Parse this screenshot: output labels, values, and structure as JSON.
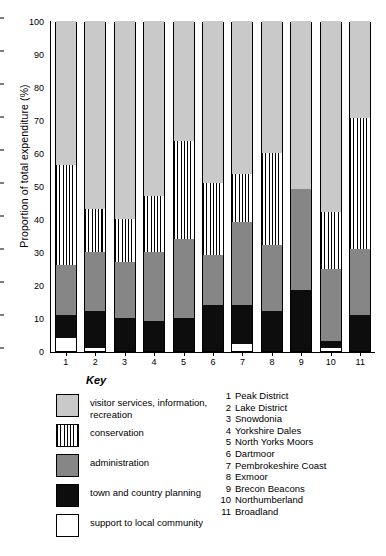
{
  "chart_data": {
    "type": "bar",
    "subtype": "stacked-bar-100-percent",
    "title": "",
    "xlabel": "",
    "ylabel": "Proportion of total expenditure (%)",
    "ylim": [
      0,
      100
    ],
    "yticks": [
      0,
      10,
      20,
      30,
      40,
      50,
      60,
      70,
      80,
      90,
      100
    ],
    "grid": false,
    "legend_position": "below-left",
    "legend_title": "Key",
    "categories": [
      "1",
      "2",
      "3",
      "4",
      "5",
      "6",
      "7",
      "8",
      "9",
      "10",
      "11"
    ],
    "category_names": [
      "Peak District",
      "Lake District",
      "Snowdonia",
      "Yorkshire Dales",
      "North Yorks Moors",
      "Dartmoor",
      "Pembrokeshire Coast",
      "Exmoor",
      "Brecon Beacons",
      "Northumberland",
      "Broadland"
    ],
    "series": [
      {
        "name": "support to local community",
        "color": "#ffffff",
        "pattern": "solid",
        "values": [
          4,
          1,
          0,
          0,
          0,
          0,
          2,
          0,
          0,
          1,
          0
        ]
      },
      {
        "name": "town and country planning",
        "color": "#0d0d0d",
        "pattern": "solid",
        "values": [
          7,
          11,
          10,
          9,
          10,
          14,
          12,
          12,
          18,
          2,
          11
        ]
      },
      {
        "name": "administration",
        "color": "#868686",
        "pattern": "solid",
        "values": [
          15,
          18,
          17,
          21,
          24,
          15,
          25,
          20,
          31,
          22,
          20
        ]
      },
      {
        "name": "conservation",
        "color": "#ffffff",
        "pattern": "vertical-lines",
        "values": [
          30.5,
          13,
          13,
          17,
          29.5,
          22,
          14.5,
          28,
          0,
          17,
          39.5
        ]
      },
      {
        "name": "visitor services, information, recreation",
        "color": "#c9c9c9",
        "pattern": "solid",
        "values": [
          43.5,
          57,
          60,
          53,
          36.5,
          49,
          46.5,
          40,
          51,
          58,
          29.5
        ]
      }
    ],
    "stack_tops": [
      {
        "category": "1",
        "support": 4,
        "town": 11,
        "admin": 26,
        "conservation": 56.5,
        "visitor": 100
      },
      {
        "category": "2",
        "support": 1,
        "town": 12,
        "admin": 30,
        "conservation": 43,
        "visitor": 100
      },
      {
        "category": "3",
        "support": 0,
        "town": 10,
        "admin": 27,
        "conservation": 40,
        "visitor": 100
      },
      {
        "category": "4",
        "support": 0,
        "town": 9,
        "admin": 30,
        "conservation": 47,
        "visitor": 100
      },
      {
        "category": "5",
        "support": 0,
        "town": 10,
        "admin": 34,
        "conservation": 63.5,
        "visitor": 100
      },
      {
        "category": "6",
        "support": 0,
        "town": 14,
        "admin": 29,
        "conservation": 51,
        "visitor": 100
      },
      {
        "category": "7",
        "support": 2,
        "town": 14,
        "admin": 39,
        "conservation": 53.5,
        "visitor": 100
      },
      {
        "category": "8",
        "support": 0,
        "town": 12,
        "admin": 32,
        "conservation": 60,
        "visitor": 100
      },
      {
        "category": "9",
        "support": 0,
        "town": 18.5,
        "admin": 49,
        "conservation": 49,
        "visitor": 100
      },
      {
        "category": "10",
        "support": 1,
        "town": 3,
        "admin": 25,
        "conservation": 42,
        "visitor": 100
      },
      {
        "category": "11",
        "support": 0,
        "town": 11,
        "admin": 31,
        "conservation": 70.5,
        "visitor": 100
      }
    ]
  },
  "axis": {
    "y_title": "Proportion of total expenditure (%)",
    "y_ticks": [
      "100",
      "90",
      "80",
      "70",
      "60",
      "50",
      "40",
      "30",
      "20",
      "10",
      "0"
    ],
    "x_ticks": [
      "1",
      "2",
      "3",
      "4",
      "5",
      "6",
      "7",
      "8",
      "9",
      "10",
      "11"
    ]
  },
  "key": {
    "title": "Key",
    "items": [
      {
        "label": "visitor services, information, recreation",
        "swatch": "visitor-services-swatch"
      },
      {
        "label": "conservation",
        "swatch": "conservation-swatch"
      },
      {
        "label": "administration",
        "swatch": "administration-swatch"
      },
      {
        "label": "town and country planning",
        "swatch": "town-and-country-planning-swatch"
      },
      {
        "label": "support to local community",
        "swatch": "support-to-local-community-swatch"
      }
    ]
  },
  "park_list": [
    {
      "num": "1",
      "name": "Peak District"
    },
    {
      "num": "2",
      "name": "Lake District"
    },
    {
      "num": "3",
      "name": "Snowdonia"
    },
    {
      "num": "4",
      "name": "Yorkshire Dales"
    },
    {
      "num": "5",
      "name": "North Yorks Moors"
    },
    {
      "num": "6",
      "name": "Dartmoor"
    },
    {
      "num": "7",
      "name": "Pembrokeshire Coast"
    },
    {
      "num": "8",
      "name": "Exmoor"
    },
    {
      "num": "9",
      "name": "Brecon Beacons"
    },
    {
      "num": "10",
      "name": "Northumberland"
    },
    {
      "num": "11",
      "name": "Broadland"
    }
  ]
}
